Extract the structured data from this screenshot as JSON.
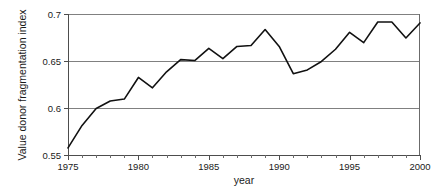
{
  "chart_data": {
    "type": "line",
    "title": "",
    "xlabel": "year",
    "ylabel": "Value donor fragmentation index",
    "xlim": [
      1975,
      2000
    ],
    "ylim": [
      0.55,
      0.7
    ],
    "grid": "horizontal",
    "legend": "none",
    "x_tick_labels": [
      "1975",
      "1980",
      "1985",
      "1990",
      "1995",
      "2000"
    ],
    "x_tick_values": [
      1975,
      1980,
      1985,
      1990,
      1995,
      2000
    ],
    "x_minor_tick_step": 1,
    "y_tick_labels": [
      "0.55",
      "0.6",
      "0.65",
      "0.7"
    ],
    "y_tick_values": [
      0.55,
      0.6,
      0.65,
      0.7
    ],
    "gridline_values": [
      0.6,
      0.65,
      0.7
    ],
    "line_color": "#111111",
    "gridline_color": "#808080",
    "x": [
      1975,
      1976,
      1977,
      1978,
      1979,
      1980,
      1981,
      1982,
      1983,
      1984,
      1985,
      1986,
      1987,
      1988,
      1989,
      1990,
      1991,
      1992,
      1993,
      1994,
      1995,
      1996,
      1997,
      1998,
      1999,
      2000
    ],
    "series": [
      {
        "name": "Value donor fragmentation index",
        "values": [
          0.5575,
          0.5815,
          0.5995,
          0.6075,
          0.6095,
          0.6325,
          0.6215,
          0.6385,
          0.6515,
          0.6505,
          0.6635,
          0.6525,
          0.6655,
          0.6665,
          0.6835,
          0.6655,
          0.6365,
          0.6405,
          0.6495,
          0.6625,
          0.6805,
          0.6695,
          0.6915,
          0.6915,
          0.6745,
          0.6905
        ]
      }
    ]
  }
}
